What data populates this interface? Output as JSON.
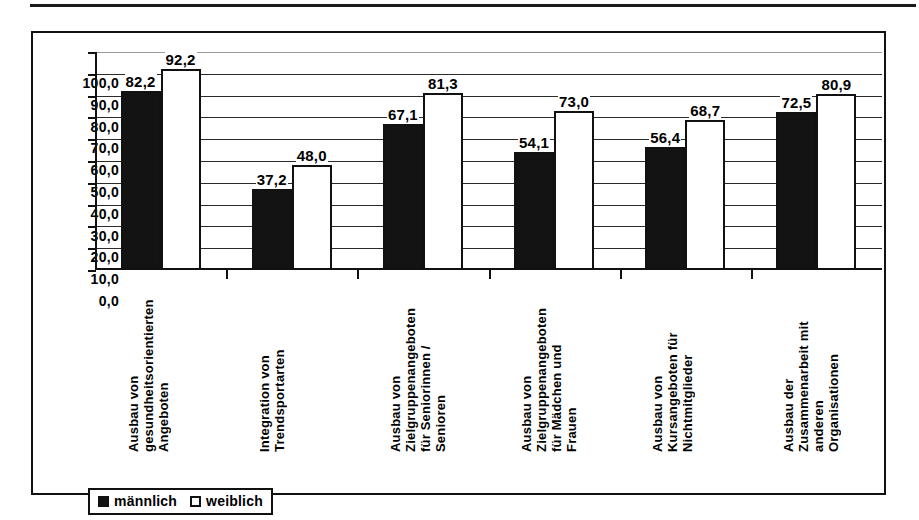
{
  "chart_data": {
    "type": "bar",
    "title": "",
    "xlabel": "",
    "ylabel": "",
    "ylim": [
      0,
      100
    ],
    "grid": true,
    "legend_position": "bottom-left",
    "yticks": [
      "0,0",
      "10,0",
      "20,0",
      "30,0",
      "40,0",
      "50,0",
      "60,0",
      "70,0",
      "80,0",
      "90,0",
      "100,0"
    ],
    "ytick_values": [
      0,
      10,
      20,
      30,
      40,
      50,
      60,
      70,
      80,
      90,
      100
    ],
    "categories": [
      "Ausbau von\ngesundheitsorientierten\nAngeboten",
      "Integration von\nTrendsportarten",
      "Ausbau von\nZielgruppenangeboten\nfür Seniorinnen /\nSenioren",
      "Ausbau von\nZielgruppenangeboten\nfür Mädchen und\nFrauen",
      "Ausbau von\nKursangeboten für\nNichtmitglieder",
      "Ausbau der\nZusammenarbeit mit\nanderen\nOrganisationen"
    ],
    "series": [
      {
        "name": "männlich",
        "color": "#131313",
        "values": [
          82.2,
          37.2,
          67.1,
          54.1,
          56.4,
          72.5
        ],
        "labels": [
          "82,2",
          "37,2",
          "67,1",
          "54,1",
          "56,4",
          "72,5"
        ]
      },
      {
        "name": "weiblich",
        "color": "#ffffff",
        "values": [
          92.2,
          48.0,
          81.3,
          73.0,
          68.7,
          80.9
        ],
        "labels": [
          "92,2",
          "48,0",
          "81,3",
          "73,0",
          "68,7",
          "80,9"
        ]
      }
    ]
  },
  "legend": {
    "items": [
      {
        "label": "männlich"
      },
      {
        "label": "weiblich"
      }
    ]
  }
}
